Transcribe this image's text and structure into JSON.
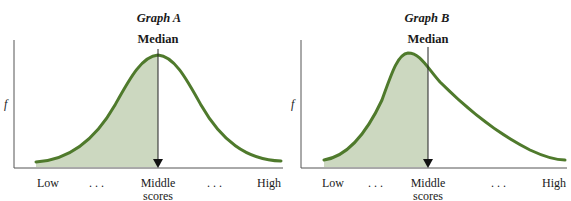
{
  "colors": {
    "curve": "#4f7a2c",
    "fill": "#ccd8c0",
    "axis": "#555555",
    "text": "#1a1a1a"
  },
  "graphs": [
    {
      "title": "Graph A",
      "median_label": "Median",
      "y_label": "f",
      "x_labels": {
        "low": "Low",
        "dots_left": ". . .",
        "middle_line1": "Middle",
        "middle_line2": "scores",
        "dots_right": ". . .",
        "high": "High"
      },
      "shape": "symmetric (normal)"
    },
    {
      "title": "Graph B",
      "median_label": "Median",
      "y_label": "f",
      "x_labels": {
        "low": "Low",
        "dots_left": ". . .",
        "middle_line1": "Middle",
        "middle_line2": "scores",
        "dots_right": ". . .",
        "high": "High"
      },
      "shape": "positively skewed"
    }
  ]
}
